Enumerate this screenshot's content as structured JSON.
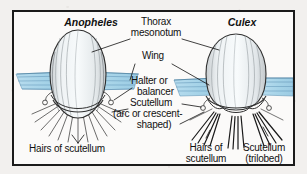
{
  "figure": {
    "type": "labeled-biological-diagram",
    "background_color": "#f2f0ee",
    "panel_color": "#fbfaf9",
    "border_color": "#1b1b1b",
    "ink_color": "#111111",
    "wing_color": "#a8d4e8",
    "wing_outline_color": "#5f93b5",
    "body_fill_color": "#eef2f4",
    "body_outline_color": "#3a3a3a"
  },
  "species": {
    "left": {
      "name": "Anopheles",
      "scutellum_shape": "arc or crescent-shaped"
    },
    "right": {
      "name": "Culex",
      "scutellum_shape": "trilobed"
    }
  },
  "labels": {
    "anopheles": "Anopheles",
    "culex": "Culex",
    "thorax": "Thorax",
    "mesonotum": "mesonotum",
    "wing": "Wing",
    "halter": "Halter or",
    "balancer": "balancer",
    "scutellum": "Scutellum",
    "arc_or_crescent": "(arc or crescent-",
    "shaped": "shaped)",
    "hairs_of_scutellum_left": "Hairs of scutellum",
    "hairs_of_left": "Hairs of",
    "scutellum_word": "scutellum",
    "scutellum_right": "Scutellum",
    "trilobed": "(trilobed)"
  }
}
